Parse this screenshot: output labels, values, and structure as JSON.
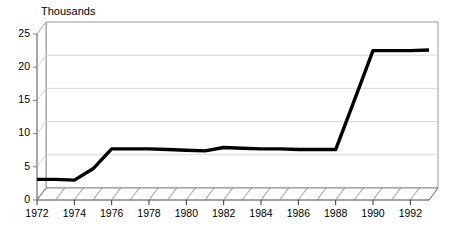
{
  "chart_data": {
    "type": "line",
    "title": "Thousands",
    "xlabel": "",
    "ylabel": "",
    "ylim": [
      0,
      25
    ],
    "xlim": [
      1972,
      1993
    ],
    "grid": true,
    "legend": false,
    "style": "3d-perspective-line",
    "line_color": "#000000",
    "background_color": "#ffffff",
    "gridline_color": "#c8c8c8",
    "axis_color": "#808080",
    "ytick_labels": [
      "0",
      "5",
      "10",
      "15",
      "20",
      "25"
    ],
    "ytick_values": [
      0,
      5,
      10,
      15,
      20,
      25
    ],
    "xtick_labels": [
      "1972",
      "1974",
      "1976",
      "1978",
      "1980",
      "1982",
      "1984",
      "1986",
      "1988",
      "1990",
      "1992"
    ],
    "xtick_values": [
      1972,
      1974,
      1976,
      1978,
      1980,
      1982,
      1984,
      1986,
      1988,
      1990,
      1992
    ],
    "x": [
      1972,
      1973,
      1974,
      1975,
      1976,
      1977,
      1978,
      1979,
      1980,
      1981,
      1982,
      1983,
      1984,
      1985,
      1986,
      1987,
      1988,
      1989,
      1990,
      1991,
      1992,
      1993
    ],
    "values": [
      3.1,
      3.1,
      3.0,
      4.7,
      7.7,
      7.7,
      7.7,
      7.6,
      7.5,
      7.4,
      7.9,
      7.8,
      7.7,
      7.7,
      7.6,
      7.6,
      7.6,
      15.0,
      22.5,
      22.5,
      22.5,
      22.6
    ],
    "series": [
      {
        "name": "series-1",
        "values": [
          3.1,
          3.1,
          3.0,
          4.7,
          7.7,
          7.7,
          7.7,
          7.6,
          7.5,
          7.4,
          7.9,
          7.8,
          7.7,
          7.7,
          7.6,
          7.6,
          7.6,
          15.0,
          22.5,
          22.5,
          22.5,
          22.6
        ]
      }
    ]
  }
}
